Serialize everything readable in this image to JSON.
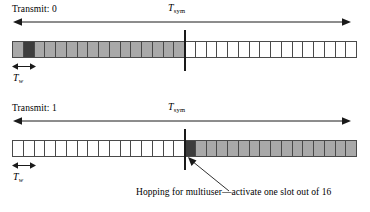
{
  "figure": {
    "background": "#ffffff",
    "line_color": "#1a1a1a",
    "cell_border_color": "#4a4a4a",
    "gray_color": "#a9a9a9",
    "dark_color": "#3d3d3d",
    "white_color": "#ffffff",
    "total_slots": 32,
    "half_slots": 16
  },
  "panels": [
    {
      "transmit_label": "Transmit: 0",
      "tsym_symbol": "T",
      "tsym_subscript": "sym",
      "tw_symbol": "T",
      "tw_subscript": "w",
      "cells": [
        "gray",
        "dark",
        "gray",
        "gray",
        "gray",
        "gray",
        "gray",
        "gray",
        "gray",
        "gray",
        "gray",
        "gray",
        "gray",
        "gray",
        "gray",
        "gray",
        "white",
        "white",
        "white",
        "white",
        "white",
        "white",
        "white",
        "white",
        "white",
        "white",
        "white",
        "white",
        "white",
        "white",
        "white",
        "white"
      ]
    },
    {
      "transmit_label": "Transmit: 1",
      "tsym_symbol": "T",
      "tsym_subscript": "sym",
      "tw_symbol": "T",
      "tw_subscript": "w",
      "cells": [
        "white",
        "white",
        "white",
        "white",
        "white",
        "white",
        "white",
        "white",
        "white",
        "white",
        "white",
        "white",
        "white",
        "white",
        "white",
        "white",
        "dark",
        "gray",
        "gray",
        "gray",
        "gray",
        "gray",
        "gray",
        "gray",
        "gray",
        "gray",
        "gray",
        "gray",
        "gray",
        "gray",
        "gray",
        "gray"
      ]
    }
  ],
  "callout": {
    "text": "Hopping for multiuser—activate one slot out of 16"
  }
}
